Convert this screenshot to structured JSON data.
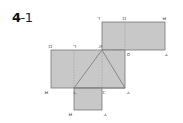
{
  "problem": {
    "number": "4",
    "sub": "-1"
  },
  "colors": {
    "fill": "#c8c8c8",
    "stroke": "#777777",
    "dash": "#999999",
    "label": "#444444"
  },
  "labels": {
    "top_g": "ㄱ",
    "top_m": "ㅁ",
    "top_b": "ㅂ",
    "mid_m": "ㅁ",
    "mid_g": "ㄱ",
    "mid_r": "ㄹ",
    "mid_o": "ㅇ",
    "mid_s": "ㅅ",
    "low_b": "ㅂ",
    "low_n": "ㄴ",
    "low_d": "ㄷ",
    "low_s": "ㅅ",
    "bot_b": "ㅂ",
    "bot_s": "ㅅ"
  }
}
